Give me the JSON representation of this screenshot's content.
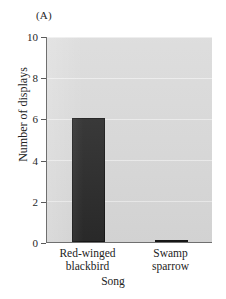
{
  "panel": {
    "label": "(A)"
  },
  "chart_data": {
    "type": "bar",
    "title": "",
    "panel_label": "(A)",
    "xlabel": "Song",
    "ylabel": "Number of displays",
    "categories": [
      "Red-winged blackbird",
      "Swamp sparrow"
    ],
    "category_lines": [
      [
        "Red-winged",
        "blackbird"
      ],
      [
        "Swamp",
        "sparrow"
      ]
    ],
    "values": [
      6.0,
      0.1
    ],
    "ylim": [
      0,
      10
    ],
    "yticks": [
      0,
      2,
      4,
      6,
      8,
      10
    ],
    "ytick_labels": [
      "0",
      "2",
      "4",
      "6",
      "8",
      "10"
    ],
    "grid": true,
    "grid_axis": "y",
    "legend": false,
    "bar_color": "#2a2a2a",
    "plot_background": "#d9d9d9",
    "gridline_color": "#efefef",
    "axis_color": "#6f6f6f"
  }
}
